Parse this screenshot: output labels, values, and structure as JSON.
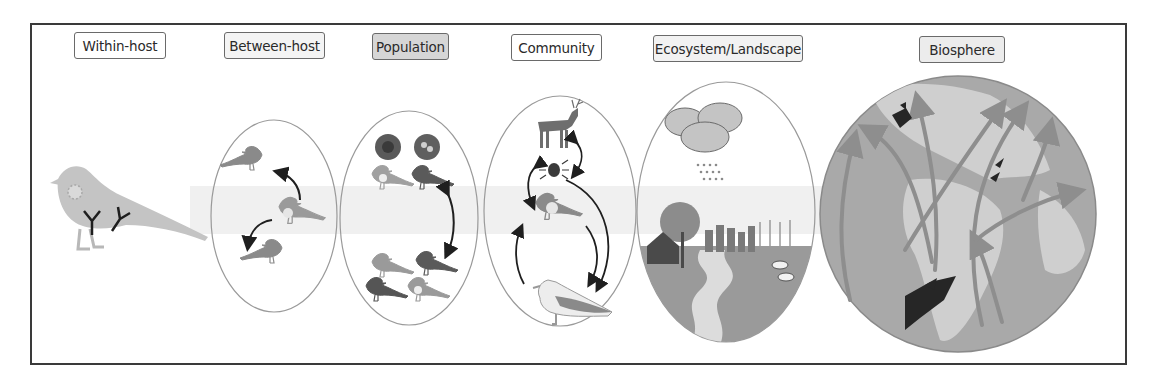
{
  "figure": {
    "type": "scale-hierarchy diagram",
    "colors": {
      "frame": "#3a3a3a",
      "ellipse_stroke": "#9a9a9a",
      "bird_dark": "#555555",
      "bird_mid": "#7d7d7d",
      "bird_light": "#b5b5b5",
      "arrow": "#1f1f1f",
      "globe_base": "#a9a9a9",
      "globe_land": "#cfcfcf",
      "globe_arrow": "#8e8e8e",
      "band": "#ececec"
    }
  },
  "scales": [
    {
      "id": "within-host",
      "label": "Within-host",
      "fill": "#ffffff",
      "x": 74,
      "y": 32,
      "w": 92
    },
    {
      "id": "between-host",
      "label": "Between-host",
      "fill": "#f4f4f4",
      "x": 224,
      "y": 32,
      "w": 101
    },
    {
      "id": "population",
      "label": "Population",
      "fill": "#d6d6d6",
      "x": 372,
      "y": 33,
      "w": 77
    },
    {
      "id": "community",
      "label": "Community",
      "fill": "#ffffff",
      "x": 511,
      "y": 34,
      "w": 91
    },
    {
      "id": "ecosystem",
      "label": "Ecosystem/Landscape",
      "fill": "#f2f2f2",
      "x": 653,
      "y": 35,
      "w": 150
    },
    {
      "id": "biosphere",
      "label": "Biosphere",
      "fill": "#ececec",
      "x": 919,
      "y": 36,
      "w": 86
    }
  ],
  "panels": {
    "within_host": {
      "content": "bird with virus particle and antibodies"
    },
    "between_host": {
      "content": "infected bird transmitting to two birds",
      "ellipse": {
        "cx": 274,
        "cy": 216,
        "rx": 63,
        "ry": 96
      }
    },
    "population": {
      "content": "two nests, six birds, bidirectional arrow",
      "ellipse": {
        "cx": 409,
        "cy": 218,
        "rx": 69,
        "ry": 107
      }
    },
    "community": {
      "content": "deer, tick, bird, gull with transmission arrows",
      "ellipse": {
        "cx": 560,
        "cy": 211,
        "rx": 76,
        "ry": 115
      }
    },
    "ecosystem": {
      "content": "clouds, rain, farmhouse, tree, city, crops, cows, river",
      "ellipse": {
        "cx": 726,
        "cy": 212,
        "rx": 89,
        "ry": 130
      }
    },
    "biosphere": {
      "content": "globe with migratory flyway arrows and bird flocks",
      "globe": {
        "cx": 958,
        "cy": 214,
        "r": 138
      }
    }
  }
}
